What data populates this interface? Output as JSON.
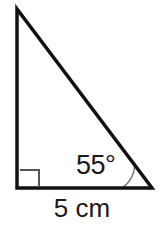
{
  "figure": {
    "name": "right-triangle-diagram",
    "background_color": "#ffffff",
    "stroke_color": "#111111",
    "marker_color": "#555555",
    "text_color": "#1a1a1a",
    "labels": {
      "angle": "55°",
      "base": "5 cm"
    },
    "geometry": {
      "type": "right-triangle",
      "apex_top_left": [
        17,
        9
      ],
      "corner_bottom_left": [
        17,
        188
      ],
      "corner_bottom_right": [
        152,
        188
      ],
      "stroke_width": 3.5,
      "right_angle_marker": {
        "at": "bottom-left",
        "size": 18,
        "inset": 2,
        "stroke_width": 2
      },
      "angle_arc": {
        "at": "bottom-right",
        "radius": 30,
        "stroke_width": 1.4,
        "measure_degrees": 55
      }
    }
  }
}
